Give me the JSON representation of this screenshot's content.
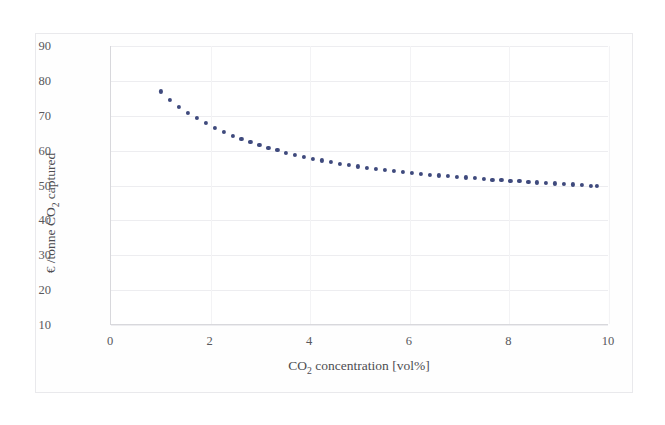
{
  "figure": {
    "background_color": "#ffffff",
    "frame_color": "#e9e9ec",
    "axis_color": "#d8d8dc",
    "grid_color": "#ededf0",
    "marker_color": "#3f4a7d",
    "tick_text_color": "#58585c",
    "label_text_color": "#4d4d51"
  },
  "chart_data": {
    "type": "scatter",
    "title": "",
    "xlabel_parts": {
      "pre": "CO",
      "sub": "2",
      "post": " concentration [vol%]"
    },
    "ylabel_parts": {
      "pre": "€ /tonne CO",
      "sub": "2",
      "post": " captured"
    },
    "xlabel": "CO2 concentration [vol%]",
    "ylabel": "€ /tonne CO2 captured",
    "xlim": [
      0,
      10
    ],
    "ylim": [
      10,
      90
    ],
    "xticks": [
      0,
      2,
      4,
      6,
      8,
      10
    ],
    "yticks": [
      10,
      20,
      30,
      40,
      50,
      60,
      70,
      80,
      90
    ],
    "xtick_labels": [
      "0",
      "2",
      "4",
      "6",
      "8",
      "10"
    ],
    "ytick_labels": [
      "10",
      "20",
      "30",
      "40",
      "50",
      "60",
      "70",
      "80",
      "90"
    ],
    "grid": {
      "horizontal": true,
      "vertical": true
    },
    "legend": null,
    "series_name": "Capture cost vs CO2 concentration",
    "marker": "circle",
    "marker_size": 4.2,
    "x": [
      1.0,
      1.18,
      1.36,
      1.54,
      1.72,
      1.9,
      2.08,
      2.26,
      2.44,
      2.62,
      2.8,
      2.98,
      3.16,
      3.34,
      3.52,
      3.7,
      3.88,
      4.06,
      4.24,
      4.42,
      4.6,
      4.78,
      4.96,
      5.14,
      5.32,
      5.5,
      5.68,
      5.86,
      6.04,
      6.22,
      6.4,
      6.58,
      6.76,
      6.94,
      7.12,
      7.3,
      7.48,
      7.66,
      7.84,
      8.02,
      8.2,
      8.38,
      8.56,
      8.74,
      8.92,
      9.1,
      9.28,
      9.46,
      9.64,
      9.75
    ],
    "y": [
      77.0,
      74.6,
      72.6,
      70.9,
      69.3,
      67.9,
      66.6,
      65.4,
      64.3,
      63.3,
      62.4,
      61.6,
      60.8,
      60.1,
      59.4,
      58.8,
      58.2,
      57.7,
      57.2,
      56.7,
      56.3,
      55.9,
      55.5,
      55.1,
      54.8,
      54.5,
      54.2,
      53.9,
      53.6,
      53.3,
      53.1,
      52.9,
      52.7,
      52.5,
      52.3,
      52.1,
      51.9,
      51.7,
      51.5,
      51.3,
      51.2,
      51.0,
      50.9,
      50.7,
      50.6,
      50.4,
      50.3,
      50.2,
      50.0,
      49.8
    ]
  }
}
